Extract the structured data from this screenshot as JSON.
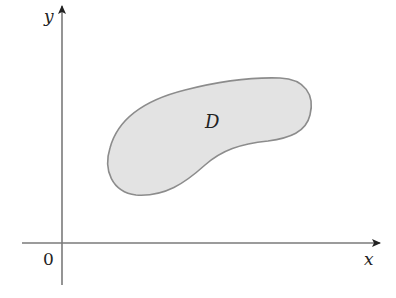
{
  "diagram": {
    "type": "region-in-plane",
    "axes": {
      "x_label": "x",
      "y_label": "y",
      "origin_label": "0",
      "axis_color": "#7a7a7a"
    },
    "region": {
      "label": "D",
      "fill_color": "#e3e3e3",
      "stroke_color": "#8c8c8c"
    }
  }
}
